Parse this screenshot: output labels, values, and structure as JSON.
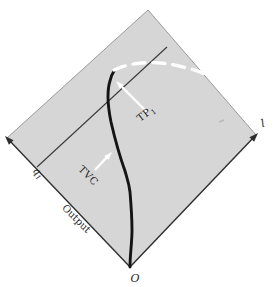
{
  "figure": {
    "labels": {
      "origin": "O",
      "labor_axis": "l",
      "output_axis": "Output",
      "quantity_base": "q",
      "quantity_sub": "1",
      "total_product_base": "TP",
      "total_product_sub": "1",
      "tvc": "TVC"
    },
    "colors": {
      "page_bg": "#ffffff",
      "diamond_fill": "#d6d6d6",
      "upper_edge": "#9a9a9a",
      "axis": "#2e2e2e",
      "curve": "#141414",
      "ray": "#3a3a3a",
      "dashed_curve": "#ffffff",
      "pointer_arrow": "#ffffff",
      "label_text": "#242424",
      "artifact": "#b9b9b9"
    }
  }
}
